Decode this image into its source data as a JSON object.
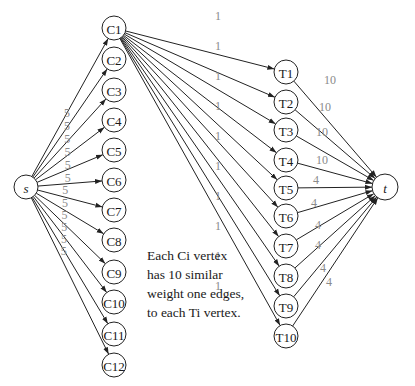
{
  "diagram": {
    "source": {
      "label": "s",
      "x": 26,
      "y": 187,
      "r": 12
    },
    "sink": {
      "label": "t",
      "x": 385,
      "y": 187,
      "r": 13
    },
    "c_nodes": [
      {
        "label": "C1",
        "x": 114,
        "y": 28
      },
      {
        "label": "C2",
        "x": 114,
        "y": 59
      },
      {
        "label": "C3",
        "x": 114,
        "y": 90
      },
      {
        "label": "C4",
        "x": 114,
        "y": 120
      },
      {
        "label": "C5",
        "x": 114,
        "y": 150
      },
      {
        "label": "C6",
        "x": 114,
        "y": 180
      },
      {
        "label": "C7",
        "x": 114,
        "y": 210
      },
      {
        "label": "C8",
        "x": 114,
        "y": 240
      },
      {
        "label": "C9",
        "x": 114,
        "y": 272
      },
      {
        "label": "C10",
        "x": 114,
        "y": 302
      },
      {
        "label": "C11",
        "x": 114,
        "y": 334
      },
      {
        "label": "C12",
        "x": 114,
        "y": 365
      }
    ],
    "t_nodes": [
      {
        "label": "T1",
        "x": 286,
        "y": 72
      },
      {
        "label": "T2",
        "x": 286,
        "y": 102
      },
      {
        "label": "T3",
        "x": 286,
        "y": 130
      },
      {
        "label": "T4",
        "x": 286,
        "y": 160
      },
      {
        "label": "T5",
        "x": 286,
        "y": 188
      },
      {
        "label": "T6",
        "x": 286,
        "y": 216
      },
      {
        "label": "T7",
        "x": 286,
        "y": 246
      },
      {
        "label": "T8",
        "x": 286,
        "y": 276
      },
      {
        "label": "T9",
        "x": 286,
        "y": 306
      },
      {
        "label": "T10",
        "x": 286,
        "y": 336
      }
    ],
    "node_radius": 12,
    "source_edge_weights": [
      "5",
      "5",
      "5",
      "5",
      "5",
      "5",
      "5",
      "5",
      "5",
      "5",
      "5",
      "5"
    ],
    "c1_edge_weights": [
      "1",
      "1",
      "1",
      "1",
      "1",
      "1",
      "1",
      "1",
      "1",
      "1"
    ],
    "sink_edge_weights": [
      "10",
      "10",
      "10",
      "10",
      "4",
      "4",
      "4",
      "4",
      "4",
      "4"
    ],
    "note_lines": [
      "Each Ci vertex",
      "has 10 similar",
      "weight one edges,",
      "to each Ti vertex."
    ],
    "colors": {
      "stroke": "#222222",
      "weight_text": "#8a8a8a",
      "background": "#ffffff"
    }
  }
}
